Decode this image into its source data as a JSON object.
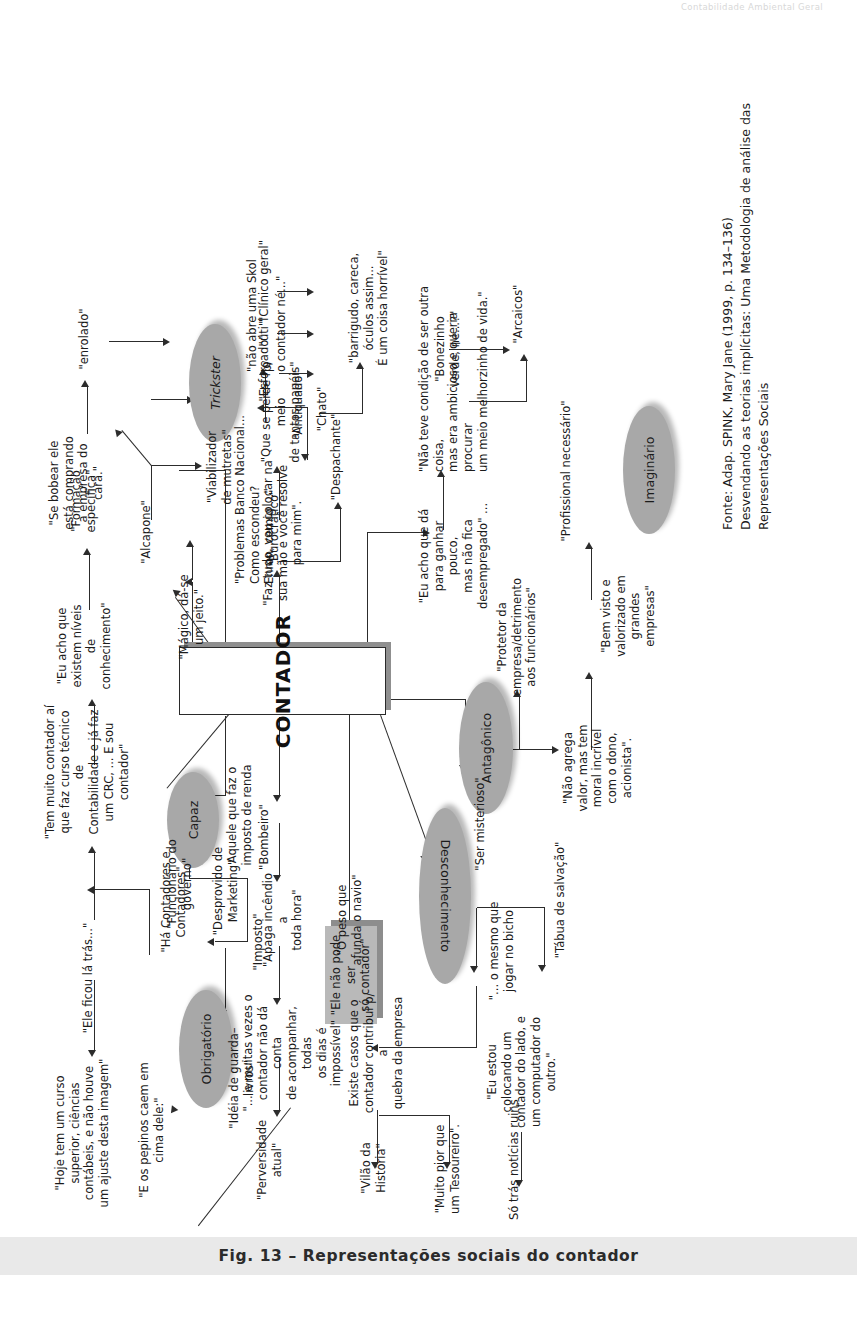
{
  "page": {
    "running_head": "Contabilidade Ambiental Geral",
    "caption": "Fig. 13 – Representações sociais do contador",
    "source": "Fonte: Adap. SPINK, Mary Jane (1999, p. 134–136)\nDesvendando as teorias implícitas: Uma Metodologia de análise das Representações Sociais"
  },
  "diagram": {
    "center": "CONTADOR",
    "categories": [
      {
        "id": "obrigatorio",
        "label": "Obrigatório"
      },
      {
        "id": "capaz",
        "label": "Capaz"
      },
      {
        "id": "trickster",
        "label": "Trickster"
      },
      {
        "id": "desconhecimento",
        "label": "Desconhecimento"
      },
      {
        "id": "antagonico",
        "label": "Antagônico"
      },
      {
        "id": "imaginario",
        "label": "Imaginário"
      }
    ],
    "highlight_box": "\"Ele não pode ser\nsó contador\"",
    "nodes": [
      {
        "id": "n01",
        "text": "\"Hoje tem um curso\nsuperior, ciências\ncontábeis, e não houve\num ajuste desta imagem\""
      },
      {
        "id": "n02",
        "text": "\"Ele ficou lá trás...\""
      },
      {
        "id": "n03",
        "text": "\"Há Contadores e\nContadores\""
      },
      {
        "id": "n04",
        "text": "\"Tem muito contador aí\nque faz curso técnico de\nContabilidade e já faz\num CRC, ... E sou\ncontador\""
      },
      {
        "id": "n05",
        "text": "\"Eu acho que\nexistem níveis de\nconhecimento\""
      },
      {
        "id": "n06",
        "text": "\"Formação\nespecífica\""
      },
      {
        "id": "n07",
        "text": "\"Se bobear ele\nestá comprando\na empresa do\ncara.\""
      },
      {
        "id": "n08",
        "text": "\"enrolado\""
      },
      {
        "id": "n09",
        "text": "\"Alcapone\""
      },
      {
        "id": "n10",
        "text": "\"Viabilizador\nde mutretas\""
      },
      {
        "id": "n11",
        "text": "\"Problemas Banco Nacional...\nComo escondeu?\nEnron, cemig ...\""
      },
      {
        "id": "n12",
        "text": "\"não abre uma Skol p/\no contador né...\""
      },
      {
        "id": "n13",
        "text": "\"Mágico, dá-se\num jeito.\""
      },
      {
        "id": "n14",
        "text": "\"Faz tudo, vou  colocar na\nsua mão e você resolve\npara mim\"."
      },
      {
        "id": "n15",
        "text": "Aquele que faz o\nimposto de renda"
      },
      {
        "id": "n16",
        "text": "\"Funcionário do\ngoverno\""
      },
      {
        "id": "n17",
        "text": "\"Imposto\""
      },
      {
        "id": "n18",
        "text": "\"E os pepinos caem em\ncima dele:\""
      },
      {
        "id": "n19",
        "text": "\"Idéia de guarda–livros\""
      },
      {
        "id": "n20",
        "text": "\"Desprovido de\nMarketing\""
      },
      {
        "id": "n21",
        "text": "\"Perversidade atual\""
      },
      {
        "id": "n22",
        "text": "\"... e muitas vezes o\ncontador não dá conta\nde acompanhar, todas\nos dias é impossível\""
      },
      {
        "id": "n23",
        "text": "\"Apaga incêndio a\ntoda hora\""
      },
      {
        "id": "n24",
        "text": "\"Bombeiro\""
      },
      {
        "id": "n25",
        "text": "\"Vilão da História\""
      },
      {
        "id": "n26",
        "text": "Existe casos que o\ncontador contribui p/ a\nquebra da empresa"
      },
      {
        "id": "n27",
        "text": "\"O peso que\nafunda o navio\""
      },
      {
        "id": "n28",
        "text": "\"Muito pior que\num Tesoureiro\"."
      },
      {
        "id": "n29",
        "text": "Só trás notícias ruins"
      },
      {
        "id": "n30",
        "text": "\"Eu estou\ncolocando um\ncontador do lado, e\num computador do\noutro.\""
      },
      {
        "id": "n31",
        "text": "\"... o mesmo que\njogar no bicho"
      },
      {
        "id": "n32",
        "text": "\"Tábua de salvação\""
      },
      {
        "id": "n33",
        "text": "\"Ser misterioso\""
      },
      {
        "id": "n34",
        "text": "\"Não agrega\nvalor, mas tem\nmoral incrível\ncom o dono,\nacionista\"."
      },
      {
        "id": "n35",
        "text": "\"Protetor da\nempresa/detrimento\naos funcionários\""
      },
      {
        "id": "n36",
        "text": "\"Bem visto e\nvalorizado em grandes\nempresas\""
      },
      {
        "id": "n37",
        "text": "\"Profissional necessário\""
      },
      {
        "id": "n38",
        "text": "\"Eu acho que dá\npara ganhar pouco,\nmas não fica\ndesempregado\" ..."
      },
      {
        "id": "n39",
        "text": "\"Despachante\""
      },
      {
        "id": "n40",
        "text": "\"Não teve condição de ser outra coisa,\nmas era ambicioso e queria procurar\num meio melhorzinho de vida.\""
      },
      {
        "id": "n41",
        "text": "\"Bonezinho\nverde, né...?\""
      },
      {
        "id": "n42",
        "text": "\"Arcaicos\""
      },
      {
        "id": "n43",
        "text": "\"Burocrático\""
      },
      {
        "id": "n44",
        "text": "\"Que se perde no meio\nde tantos papéis\""
      },
      {
        "id": "n45",
        "text": "\"Antiquado\""
      },
      {
        "id": "n46",
        "text": "\"Chato\""
      },
      {
        "id": "n47",
        "text": "\"barrigudo, careca,\nóculos assim...\nÉ um coisa horrível\""
      },
      {
        "id": "n48",
        "text": "\"Esforçado\""
      },
      {
        "id": "n49",
        "text": "\"úti\"l"
      },
      {
        "id": "n50",
        "text": "\"Clínico geral\""
      }
    ]
  },
  "colors": {
    "ellipse_fill": "#a8a8a8",
    "grey_box_fill": "#b9b9b9",
    "caption_bar": "#e9e9e9",
    "ink": "#1b1b1b"
  }
}
